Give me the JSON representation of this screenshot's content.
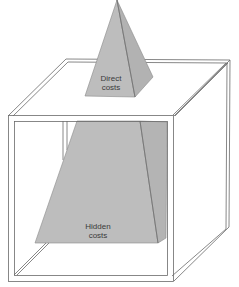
{
  "diagram": {
    "type": "iceberg-box",
    "colors": {
      "background": "#ffffff",
      "shape_fill": "#bdbdbd",
      "shape_edge": "#8a8a8a",
      "frame_line": "#6a6a6a",
      "label_text": "#3a3a3a"
    },
    "visible_part": {
      "label_line1": "Direct",
      "label_line2": "costs"
    },
    "hidden_part": {
      "label_line1": "Hidden",
      "label_line2": "costs"
    }
  }
}
